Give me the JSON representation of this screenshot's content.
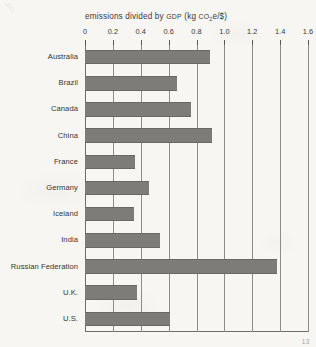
{
  "page": {
    "page_number": "13"
  },
  "chart_data": {
    "type": "bar",
    "orientation": "horizontal",
    "title": "emissions divided by GDP (kg CO2e/$)",
    "title_parts": {
      "lead": "emissions divided by ",
      "gdp": "GDP",
      "mid": " (kg ",
      "co": "CO",
      "sub": "2",
      "e_unit": "e/$)"
    },
    "xlabel": "",
    "ylabel": "",
    "xlim": [
      0,
      1.6
    ],
    "grid": true,
    "legend": "none",
    "tick_labels": [
      "0",
      "0.2",
      "0.4",
      "0.6",
      "0.8",
      "1.0",
      "1.2",
      "1.4",
      "1.6"
    ],
    "tick_values": [
      0,
      0.2,
      0.4,
      0.6,
      0.8,
      1.0,
      1.2,
      1.4,
      1.6
    ],
    "categories": [
      "Australia",
      "Brazil",
      "Canada",
      "China",
      "France",
      "Germany",
      "Iceland",
      "India",
      "Russian Federation",
      "U.K.",
      "U.S."
    ],
    "values": [
      0.9,
      0.66,
      0.76,
      0.91,
      0.36,
      0.46,
      0.35,
      0.54,
      1.38,
      0.37,
      0.61
    ],
    "bar_color": "#7e7c79",
    "axis_color": "#6f6d69",
    "grid_color": "#8e8c88",
    "background_color": "#f7f6f2"
  }
}
